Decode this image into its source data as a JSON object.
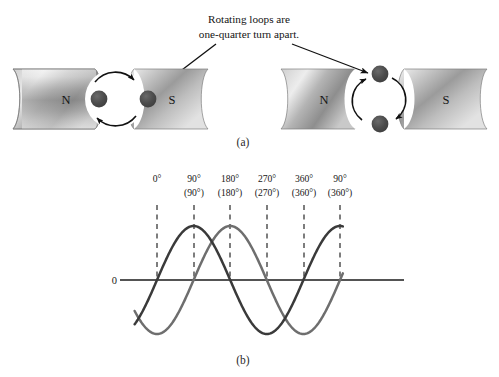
{
  "figure": {
    "panel_a": {
      "caption": "(a)",
      "annotation": {
        "line1": "Rotating loops are",
        "line2": "one-quarter turn apart."
      },
      "assemblies": [
        {
          "name": "left-assembly",
          "north_label": "N",
          "south_label": "S",
          "loop_orientation": "horizontal",
          "conductor_positions": [
            "left",
            "right"
          ]
        },
        {
          "name": "right-assembly",
          "north_label": "N",
          "south_label": "S",
          "loop_orientation": "vertical",
          "conductor_positions": [
            "top",
            "bottom"
          ]
        }
      ]
    },
    "panel_b": {
      "caption": "(b)",
      "zero_label": "0"
    }
  },
  "chart_data": {
    "type": "line",
    "title": "",
    "xlabel": "",
    "ylabel": "",
    "grid": false,
    "legend": "none",
    "axis_x_range_px": [
      120,
      404
    ],
    "zero_line_label": "0",
    "x_ticks": [
      {
        "primary": "0°",
        "secondary": "(0°)",
        "x_px": 157
      },
      {
        "primary": "90°",
        "secondary": "(90°)",
        "x_px": 194
      },
      {
        "primary": "180°",
        "secondary": "(180°)",
        "x_px": 230
      },
      {
        "primary": "270°",
        "secondary": "(270°)",
        "x_px": 267
      },
      {
        "primary": "360°",
        "secondary": "(360°)",
        "x_px": 304
      },
      {
        "primary": "90°",
        "secondary": "(360°)",
        "x_px": 340
      }
    ],
    "tick_labels_row1": [
      "0°",
      "90°",
      "180°",
      "270°",
      "360°",
      "90°"
    ],
    "tick_labels_row2": [
      "",
      "(0°)",
      "(90°)",
      "(180°)",
      "(270°)",
      "(360°)"
    ],
    "x": [
      0,
      45,
      90,
      135,
      180,
      225,
      270,
      315,
      360,
      405,
      450,
      495,
      540
    ],
    "series": [
      {
        "name": "loop-1-emf",
        "color": "#3a3a3a",
        "phase_deg": 0,
        "amplitude": 1.0,
        "values": [
          0,
          0.707,
          1,
          0.707,
          0,
          -0.707,
          -1,
          -0.707,
          0,
          0.707,
          1,
          0.707,
          0
        ]
      },
      {
        "name": "loop-2-emf",
        "color": "#6e6e6e",
        "phase_deg": -90,
        "amplitude": 1.0,
        "values": [
          -1,
          -0.707,
          0,
          0.707,
          1,
          0.707,
          0,
          -0.707,
          -1,
          -0.707,
          0,
          0.707,
          1
        ]
      }
    ],
    "ylim": [
      -1.15,
      1.15
    ],
    "annotation": "Two emf waveforms 90 degrees out of phase"
  },
  "colors": {
    "wave_dark": "#3a3a3a",
    "wave_light": "#6e6e6e",
    "magnet_light": "#f2f2f2",
    "magnet_mid": "#9a9a9a",
    "magnet_dark": "#6b6b6b",
    "conductor": "#4a4a4a",
    "axis": "#1a1a1a"
  }
}
